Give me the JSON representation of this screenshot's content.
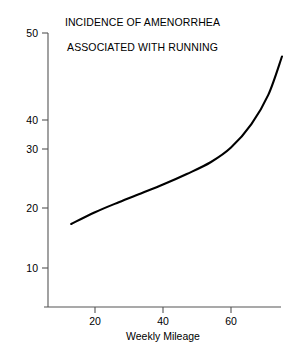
{
  "chart_data": {
    "type": "line",
    "title": "INCIDENCE OF AMENORRHEA ASSOCIATED WITH RUNNING",
    "title_lines": [
      "INCIDENCE OF AMENORRHEA",
      "ASSOCIATED WITH RUNNING"
    ],
    "xlabel": "Weekly Mileage",
    "ylabel": "",
    "xlim": [
      6,
      78
    ],
    "ylim": [
      6,
      51
    ],
    "xticks": [
      20,
      40,
      60
    ],
    "xtick_labels": [
      "20",
      "40",
      "60"
    ],
    "yticks": [
      10,
      20,
      30,
      40,
      50
    ],
    "ytick_labels": [
      "10",
      "20",
      "30",
      "40",
      "50"
    ],
    "grid": false,
    "legend": false,
    "series": [
      {
        "name": "Incidence of amenorrhea",
        "color": "#000000",
        "x": [
          13,
          20,
          27,
          34,
          40,
          47,
          54,
          60,
          66,
          71,
          75
        ],
        "y": [
          17.5,
          19.5,
          21.2,
          22.8,
          24.2,
          26.0,
          28.0,
          30.5,
          34.5,
          39.5,
          46.0
        ]
      }
    ]
  },
  "axes": {
    "y_axis_label_name": "y-axis",
    "x_axis_label_name": "x-axis",
    "x_axis_title": "Weekly Mileage"
  },
  "colors": {
    "background": "#ffffff",
    "axis": "#555555",
    "curve": "#000000",
    "text": "#000000"
  }
}
